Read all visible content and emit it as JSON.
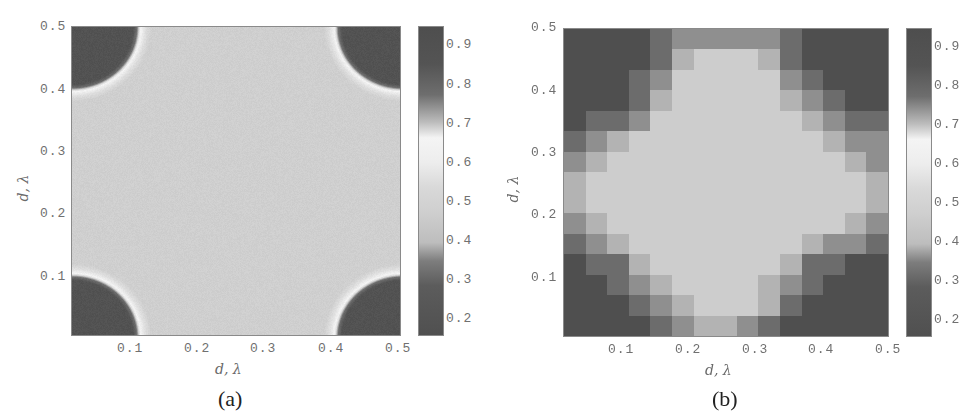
{
  "figure": {
    "panels": [
      {
        "id": "a",
        "caption": "(a)",
        "xlabel": "d,  λ",
        "ylabel": "d,  λ",
        "xticks": [
          "0.1",
          "0.2",
          "0.3",
          "0.4",
          "0.5"
        ],
        "yticks": [
          "0.1",
          "0.2",
          "0.3",
          "0.4",
          "0.5"
        ],
        "colorbar_ticks": [
          "0.9",
          "0.8",
          "0.7",
          "0.6",
          "0.5",
          "0.4",
          "0.3",
          "0.2"
        ]
      },
      {
        "id": "b",
        "caption": "(b)",
        "xlabel": "d,  λ",
        "ylabel": "d,  λ",
        "xticks": [
          "0.1",
          "0.2",
          "0.3",
          "0.4",
          "0.5"
        ],
        "yticks": [
          "0.1",
          "0.2",
          "0.3",
          "0.4",
          "0.5"
        ],
        "colorbar_ticks": [
          "0.9",
          "0.8",
          "0.7",
          "0.6",
          "0.5",
          "0.4",
          "0.3",
          "0.2"
        ]
      }
    ]
  },
  "chart_data": [
    {
      "type": "heatmap",
      "title": "(a)",
      "xlabel": "d, λ",
      "ylabel": "d, λ",
      "xlim": [
        0.0167,
        0.5
      ],
      "ylim": [
        0.0167,
        0.5
      ],
      "colorbar": {
        "range": [
          0.15,
          0.95
        ],
        "ticks": [
          0.2,
          0.3,
          0.4,
          0.5,
          0.6,
          0.7,
          0.8,
          0.9
        ],
        "colormap": "gray: dark at both ends, white near 0.65"
      },
      "description": "Smooth field ~0.5 (light gray) over most of the domain; four corner regions (radius ~0.1) with dark values ~0.85-0.9, bordered by a thin white ring (~0.65).",
      "features": {
        "background_value": 0.5,
        "corner_value": 0.88,
        "ring_value": 0.65,
        "corner_radius": 0.1,
        "corners": [
          [
            0.0167,
            0.0167
          ],
          [
            0.5,
            0.0167
          ],
          [
            0.0167,
            0.5
          ],
          [
            0.5,
            0.5
          ]
        ]
      }
    },
    {
      "type": "heatmap",
      "title": "(b)",
      "xlabel": "d, λ",
      "ylabel": "d, λ",
      "xlim": [
        0.0167,
        0.5
      ],
      "ylim": [
        0.0167,
        0.5
      ],
      "grid_size": [
        15,
        15
      ],
      "colorbar": {
        "range": [
          0.15,
          0.95
        ],
        "ticks": [
          0.2,
          0.3,
          0.4,
          0.5,
          0.6,
          0.7,
          0.8,
          0.9
        ],
        "colormap": "gray: dark at both ends, white near 0.65"
      },
      "levels_note": "Matrix rows from top (y=0.5) to bottom (y≈0.02); 0 = light center (~0.5), 4 = darkest (~0.9)",
      "matrix": [
        [
          4,
          4,
          4,
          4,
          3,
          2,
          2,
          2,
          2,
          2,
          3,
          4,
          4,
          4,
          4
        ],
        [
          4,
          4,
          4,
          4,
          3,
          1,
          0,
          0,
          0,
          1,
          3,
          4,
          4,
          4,
          4
        ],
        [
          4,
          4,
          4,
          3,
          2,
          0,
          0,
          0,
          0,
          0,
          2,
          3,
          4,
          4,
          4
        ],
        [
          4,
          4,
          4,
          3,
          1,
          0,
          0,
          0,
          0,
          0,
          1,
          2,
          3,
          4,
          4
        ],
        [
          4,
          3,
          3,
          2,
          0,
          0,
          0,
          0,
          0,
          0,
          0,
          1,
          2,
          3,
          3
        ],
        [
          3,
          2,
          1,
          0,
          0,
          0,
          0,
          0,
          0,
          0,
          0,
          0,
          1,
          2,
          2
        ],
        [
          2,
          1,
          0,
          0,
          0,
          0,
          0,
          0,
          0,
          0,
          0,
          0,
          0,
          1,
          2
        ],
        [
          1,
          0,
          0,
          0,
          0,
          0,
          0,
          0,
          0,
          0,
          0,
          0,
          0,
          0,
          1
        ],
        [
          1,
          0,
          0,
          0,
          0,
          0,
          0,
          0,
          0,
          0,
          0,
          0,
          0,
          0,
          1
        ],
        [
          2,
          1,
          0,
          0,
          0,
          0,
          0,
          0,
          0,
          0,
          0,
          0,
          0,
          1,
          2
        ],
        [
          3,
          2,
          1,
          0,
          0,
          0,
          0,
          0,
          0,
          0,
          0,
          1,
          2,
          2,
          3
        ],
        [
          4,
          3,
          3,
          1,
          0,
          0,
          0,
          0,
          0,
          0,
          1,
          3,
          3,
          4,
          4
        ],
        [
          4,
          4,
          3,
          2,
          1,
          0,
          0,
          0,
          0,
          1,
          2,
          3,
          4,
          4,
          4
        ],
        [
          4,
          4,
          4,
          3,
          2,
          1,
          0,
          0,
          0,
          1,
          3,
          4,
          4,
          4,
          4
        ],
        [
          4,
          4,
          4,
          4,
          3,
          2,
          1,
          1,
          2,
          3,
          4,
          4,
          4,
          4,
          4
        ]
      ],
      "level_colors": [
        "#cdcdcd",
        "#b3b3b3",
        "#8f8f8f",
        "#6c6c6c",
        "#4f4f4f"
      ]
    }
  ]
}
